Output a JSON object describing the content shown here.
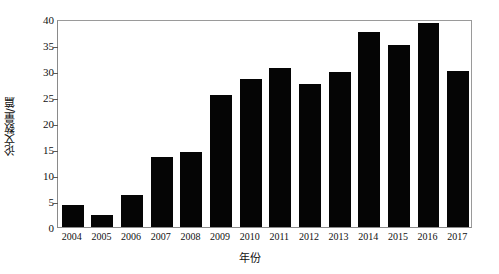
{
  "chart_data": {
    "type": "bar",
    "title": "",
    "xlabel": "年份",
    "ylabel": "论文数量/篇",
    "categories": [
      "2004",
      "2005",
      "2006",
      "2007",
      "2008",
      "2009",
      "2010",
      "2011",
      "2012",
      "2013",
      "2014",
      "2015",
      "2016",
      "2017"
    ],
    "values": [
      4.3,
      2.3,
      6.2,
      13.5,
      14.5,
      25.3,
      28.5,
      30.6,
      27.5,
      29.8,
      37.5,
      35.0,
      39.3,
      30.0
    ],
    "ylim": [
      0,
      40
    ],
    "yticks": [
      "0",
      "5",
      "10",
      "15",
      "20",
      "25",
      "30",
      "35",
      "40"
    ],
    "ytick_values": [
      0,
      5,
      10,
      15,
      20,
      25,
      30,
      35,
      40
    ],
    "grid": false,
    "legend": null,
    "bar_color": "#050505",
    "axis_color": "#8a8a8a",
    "background_color": "#ffffff"
  }
}
